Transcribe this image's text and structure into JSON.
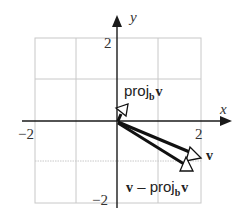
{
  "diagram": {
    "type": "vector-projection",
    "axes": {
      "x_label": "x",
      "y_label": "y",
      "x_ticks": [
        {
          "value": -2,
          "label": "−2"
        },
        {
          "value": 2,
          "label": "2"
        }
      ],
      "y_ticks": [
        {
          "value": 2,
          "label": "2"
        },
        {
          "value": -2,
          "label": "−2"
        }
      ],
      "range": {
        "x": [
          -2,
          2
        ],
        "y": [
          -2,
          2
        ]
      },
      "grid": true,
      "grid_step": 1
    },
    "vectors": [
      {
        "name": "v",
        "label_main": "v",
        "from": [
          0,
          0
        ],
        "to": [
          2,
          -1
        ]
      },
      {
        "name": "proj_b v",
        "label_main": "proj",
        "label_sub": "b",
        "label_vec": "v",
        "from": [
          0,
          0
        ],
        "to": [
          0.2,
          0.4
        ]
      },
      {
        "name": "v - proj_b v",
        "label_prefix": "v",
        "label_minus": " – ",
        "label_main": "proj",
        "label_sub": "b",
        "label_vec": "v",
        "from": [
          0,
          0
        ],
        "to": [
          1.8,
          -1.4
        ]
      }
    ],
    "colors": {
      "grid": "#c8c8c8",
      "axis": "#1a1a1a",
      "vector": "#111111",
      "arrowhead_fill": "#ffffff"
    }
  }
}
